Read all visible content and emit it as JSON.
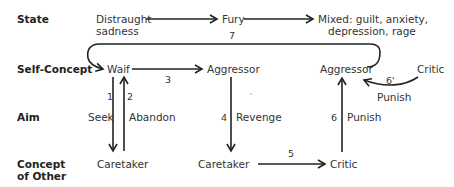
{
  "row_labels": {
    "state": "State",
    "self_concept": "Self-Concept",
    "aim": "Aim",
    "concept_other_1": "Concept",
    "concept_other_2": "of Other"
  },
  "nodes": {
    "state_1_line1": "Distraught",
    "state_1_line2": "sadness",
    "state_2": "Fury",
    "state_3_line1": "Mixed: guilt, anxiety,",
    "state_3_line2": "depression, rage",
    "self_1": "Waif",
    "self_2": "Aggressor",
    "self_3": "Aggressor",
    "critic_top": "Critic",
    "other_1": "Caretaker",
    "other_2": "Caretaker",
    "other_3": "Critic"
  },
  "edges": {
    "e1": {
      "num": "1",
      "label": "Seek"
    },
    "e2": {
      "num": "2",
      "label": "Abandon"
    },
    "e3": {
      "num": "3"
    },
    "e4": {
      "num": "4",
      "label": "Revenge"
    },
    "e5": {
      "num": "5"
    },
    "e6": {
      "num": "6",
      "label": "Punish"
    },
    "e6p": {
      "num": "6'",
      "label": "Punish"
    },
    "e7": {
      "num": "7"
    }
  }
}
